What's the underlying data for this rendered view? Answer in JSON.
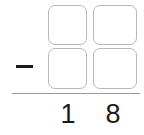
{
  "problem": {
    "operator_symbol": "−",
    "operator_name": "minus-sign",
    "rule_name": "subtraction-bar",
    "accent_color": "#1a1a1a",
    "box_border_color": "#b8b8b8",
    "rule_color": "#9a9a9a",
    "background_color": "#ffffff",
    "answer_grid": {
      "rows": 2,
      "columns": 2,
      "cells": [
        {
          "row": 0,
          "column": 0,
          "value": "",
          "placeholder": ""
        },
        {
          "row": 0,
          "column": 1,
          "value": "",
          "placeholder": ""
        },
        {
          "row": 1,
          "column": 0,
          "value": "",
          "placeholder": ""
        },
        {
          "row": 1,
          "column": 1,
          "value": "",
          "placeholder": ""
        }
      ]
    },
    "result_digits": [
      {
        "position": "tens",
        "value": "1"
      },
      {
        "position": "ones",
        "value": "8"
      }
    ]
  }
}
